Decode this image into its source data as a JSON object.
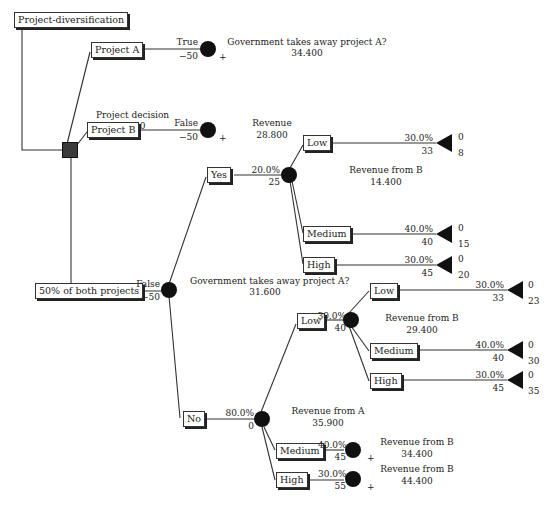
{
  "root": {
    "label": "Project-diversification"
  },
  "decision": {
    "title": "Project decision",
    "value": "34.400"
  },
  "branch_a": {
    "label": "Project A",
    "outcome": "True",
    "cost": "−50",
    "node_title": "Government takes away project A?",
    "node_value": "34.400"
  },
  "branch_b": {
    "label": "Project B",
    "outcome": "False",
    "cost": "−50",
    "node_title": "Revenue",
    "node_value": "28.800"
  },
  "branch_both": {
    "label": "50% of both projects",
    "outcome": "False",
    "cost": "−50",
    "node_title": "Government takes away project A?",
    "node_value": "31.600",
    "yes": {
      "label": "Yes",
      "prob": "20.0%",
      "value": "25",
      "node_title": "Revenue from B",
      "node_value": "14.400",
      "children": [
        {
          "label": "Low",
          "prob": "30.0%",
          "value": "33",
          "t_top": "0",
          "t_bot": "8"
        },
        {
          "label": "Medium",
          "prob": "40.0%",
          "value": "40",
          "t_top": "0",
          "t_bot": "15"
        },
        {
          "label": "High",
          "prob": "30.0%",
          "value": "45",
          "t_top": "0",
          "t_bot": "20"
        }
      ]
    },
    "no": {
      "label": "No",
      "prob": "80.0%",
      "value": "0",
      "node_title": "Revenue from A",
      "node_value": "35.900",
      "low": {
        "label": "Low",
        "prob": "30.0%",
        "value": "40",
        "node_title": "Revenue from B",
        "node_value": "29.400",
        "children": [
          {
            "label": "Low",
            "prob": "30.0%",
            "value": "33",
            "t_top": "0",
            "t_bot": "23"
          },
          {
            "label": "Medium",
            "prob": "40.0%",
            "value": "40",
            "t_top": "0",
            "t_bot": "30"
          },
          {
            "label": "High",
            "prob": "30.0%",
            "value": "45",
            "t_top": "0",
            "t_bot": "35"
          }
        ]
      },
      "medium": {
        "label": "Medium",
        "prob": "40.0%",
        "value": "45",
        "node_title": "Revenue from B",
        "node_value": "34.400"
      },
      "high": {
        "label": "High",
        "prob": "30.0%",
        "value": "55",
        "node_title": "Revenue from B",
        "node_value": "44.400"
      }
    }
  },
  "plus_sign": "+"
}
